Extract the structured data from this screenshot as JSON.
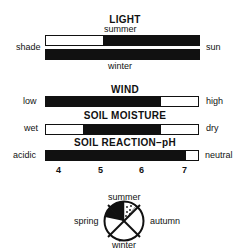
{
  "cut_text": "species-y",
  "light": {
    "title": "LIGHT",
    "top_label": "summer",
    "bottom_label": "winter",
    "left_label": "shade",
    "right_label": "sun",
    "summer_filled": [
      0.37,
      1.0
    ],
    "winter_filled": [
      0.0,
      1.0
    ]
  },
  "wind": {
    "title": "WIND",
    "left_label": "low",
    "right_label": "high",
    "filled": [
      0.0,
      0.75
    ]
  },
  "soil_moisture": {
    "title": "SOIL MOISTURE",
    "left_label": "wet",
    "right_label": "dry",
    "filled": [
      0.24,
      0.75
    ]
  },
  "soil_reaction": {
    "title": "SOIL REACTION–pH",
    "left_label": "acidic",
    "right_label": "neutral",
    "filled": [
      0.0,
      0.91
    ]
  },
  "ph_scale": [
    "4",
    "5",
    "6",
    "7"
  ],
  "seasons": {
    "top": "summer",
    "left": "spring",
    "right": "autumn",
    "bottom": "winter"
  }
}
